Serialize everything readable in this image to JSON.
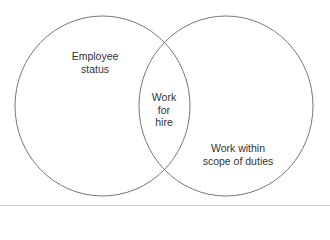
{
  "diagram": {
    "type": "venn",
    "sets": [
      {
        "id": "left",
        "label_lines": [
          "Employee",
          "status"
        ]
      },
      {
        "id": "right",
        "label_lines": [
          "Work within",
          "scope of duties"
        ]
      }
    ],
    "intersection": {
      "label_lines": [
        "Work",
        "for",
        "hire"
      ]
    },
    "colors": {
      "stroke": "#777777",
      "text": "#333333",
      "background": "#ffffff"
    }
  }
}
